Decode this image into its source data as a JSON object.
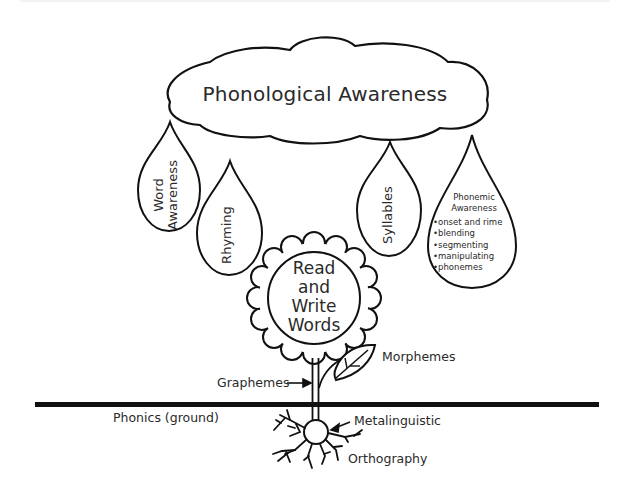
{
  "diagram": {
    "title": "Phonological Awareness",
    "drops": [
      {
        "id": "word-awareness",
        "lines": [
          "Word",
          "Awareness"
        ]
      },
      {
        "id": "rhyming",
        "label": "Rhyming"
      },
      {
        "id": "syllables",
        "label": "Syllables"
      },
      {
        "id": "phonemic-awareness",
        "title_lines": [
          "Phonemic",
          "Awareness"
        ],
        "items": [
          "onset and rime",
          "blending",
          "segmenting",
          "manipulating",
          "phonemes"
        ]
      }
    ],
    "flower": {
      "lines": [
        "Read",
        "and",
        "Write",
        "Words"
      ]
    },
    "labels": {
      "morphemes": "Morphemes",
      "graphemes": "Graphemes",
      "ground": "Phonics (ground)",
      "metalinguistic": "Metalinguistic",
      "orthography": "Orthography"
    },
    "colors": {
      "stroke": "#111111",
      "text": "#2a2a2a",
      "background": "#ffffff"
    }
  }
}
